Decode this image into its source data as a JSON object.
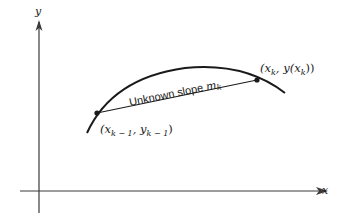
{
  "diagram": {
    "axes": {
      "x_label": "x",
      "y_label": "y"
    },
    "curve": {
      "description": "concave-down curve y(x)"
    },
    "secant": {
      "label_text": "Unknown slope ",
      "label_var": "m",
      "label_sub": "k"
    },
    "points": [
      {
        "name": "previous-point",
        "label_prefix": "(x",
        "label_sub1": "k − 1",
        "label_mid": ", y",
        "label_sub2": "k − 1",
        "label_suffix": ")"
      },
      {
        "name": "current-point",
        "label_prefix": "(x",
        "label_sub1": "k",
        "label_mid": ", y(x",
        "label_sub2": "k",
        "label_suffix": "))"
      }
    ],
    "colors": {
      "ink": "#1a1a1a",
      "axis": "#3a3a3a",
      "background": "#ffffff"
    }
  }
}
